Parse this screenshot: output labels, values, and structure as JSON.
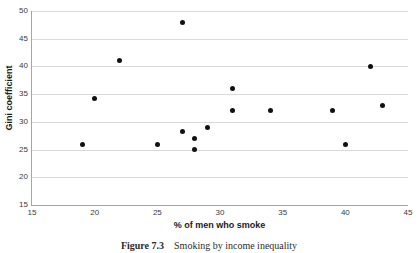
{
  "chart_data": {
    "type": "scatter",
    "title": "",
    "xlabel": "% of men who smoke",
    "ylabel": "Gini coefficient",
    "xlim": [
      15,
      45
    ],
    "ylim": [
      15,
      50
    ],
    "xticks": [
      15,
      20,
      25,
      30,
      35,
      40,
      45
    ],
    "yticks": [
      15,
      20,
      25,
      30,
      35,
      40,
      45,
      50
    ],
    "grid": "horizontal",
    "legend": "none",
    "marker_color": "#111111",
    "gridline_color": "#d9d9d9",
    "axis_color": "#a6a6a6",
    "points": [
      {
        "x": 19,
        "y": 26
      },
      {
        "x": 20,
        "y": 34.2
      },
      {
        "x": 22,
        "y": 41
      },
      {
        "x": 25,
        "y": 26
      },
      {
        "x": 27,
        "y": 48
      },
      {
        "x": 27,
        "y": 28.2
      },
      {
        "x": 28,
        "y": 27
      },
      {
        "x": 28,
        "y": 25
      },
      {
        "x": 29,
        "y": 29
      },
      {
        "x": 31,
        "y": 36
      },
      {
        "x": 31,
        "y": 32
      },
      {
        "x": 34,
        "y": 32
      },
      {
        "x": 39,
        "y": 32
      },
      {
        "x": 40,
        "y": 26
      },
      {
        "x": 42,
        "y": 40
      },
      {
        "x": 43,
        "y": 33
      }
    ]
  },
  "caption": {
    "label": "Figure 7.3",
    "text": "Smoking by income inequality"
  }
}
